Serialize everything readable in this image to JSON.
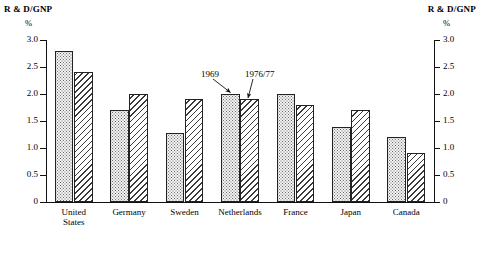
{
  "axes": {
    "left_caption": "R & D/GNP",
    "right_caption": "R & D/GNP",
    "left_unit": "%",
    "right_unit": "%",
    "ticks": [
      "3.0",
      "2.5",
      "2.0",
      "1.5",
      "1.0",
      "0.5",
      "0"
    ]
  },
  "annotations": [
    {
      "label": "1969"
    },
    {
      "label": "1976/77"
    }
  ],
  "categories_display": [
    [
      "United",
      "States"
    ],
    [
      "Germany"
    ],
    [
      "Sweden"
    ],
    [
      "Netherlands"
    ],
    [
      "France"
    ],
    [
      "Japan"
    ],
    [
      "Canada"
    ]
  ],
  "chart_data": {
    "type": "bar",
    "title": "",
    "xlabel": "",
    "ylabel": "R & D/GNP %",
    "ylim": [
      0,
      3.0
    ],
    "ytick_values": [
      3.0,
      2.5,
      2.0,
      1.5,
      1.0,
      0.5,
      0
    ],
    "ytick_labels": [
      "3.0",
      "2.5",
      "2.0",
      "1.5",
      "1.0",
      "0.5",
      "0"
    ],
    "grid": false,
    "legend": "annotated-arrows",
    "dual_axis": true,
    "categories": [
      "United States",
      "Germany",
      "Sweden",
      "Netherlands",
      "France",
      "Japan",
      "Canada"
    ],
    "series": [
      {
        "name": "1969",
        "fill": "dotted",
        "values": [
          2.8,
          1.7,
          1.28,
          2.0,
          2.0,
          1.38,
          1.2
        ]
      },
      {
        "name": "1976/77",
        "fill": "hatched",
        "values": [
          2.4,
          2.0,
          1.9,
          1.9,
          1.8,
          1.7,
          0.9
        ]
      }
    ]
  }
}
